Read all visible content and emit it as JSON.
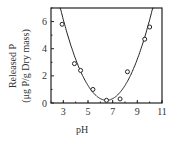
{
  "chart_data": {
    "type": "scatter",
    "title": "",
    "xlabel": "pH",
    "ylabel": "Released P",
    "ylabel_units": "(μg P/g Dry mass)",
    "xlim": [
      2,
      11
    ],
    "ylim": [
      0,
      7
    ],
    "xticks": [
      "3",
      "5",
      "7",
      "9",
      "11"
    ],
    "yticks": [
      "0",
      "2",
      "4",
      "6"
    ],
    "grid": false,
    "legend": null,
    "series": [
      {
        "name": "observed",
        "marker": "open-circle",
        "x": [
          2.9,
          3.9,
          4.4,
          5.4,
          6.5,
          7.6,
          8.2,
          9.6,
          10.0
        ],
        "y": [
          5.8,
          2.9,
          2.4,
          1.0,
          0.2,
          0.3,
          2.3,
          4.7,
          5.6
        ]
      },
      {
        "name": "fitted curve",
        "type": "line",
        "x": [
          2.6,
          3.0,
          4.0,
          5.0,
          6.0,
          6.5,
          7.0,
          8.0,
          9.0,
          10.0,
          10.5
        ],
        "y": [
          7.0,
          5.6,
          3.0,
          1.2,
          0.3,
          0.2,
          0.4,
          1.5,
          3.2,
          5.6,
          7.0
        ]
      }
    ]
  }
}
